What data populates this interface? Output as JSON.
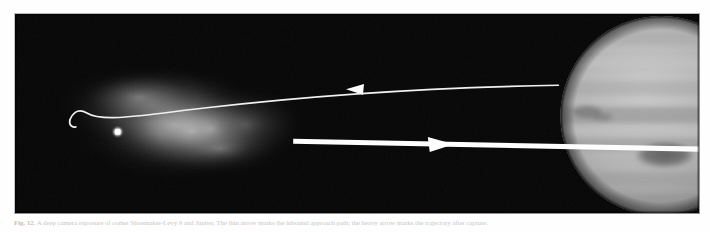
{
  "figure": {
    "caption_label": "Fig. 12.",
    "caption_text": "A deep camera exposure of comet Shoemaker-Levy 9 and Jupiter. The thin arrow marks the inbound approach path; the heavy arrow marks the trajectory after capture.",
    "alt": "Grayscale astronomical photograph: diffuse comet coma at left with bright nucleus, two white trajectory arrows pointing toward and away from the banded disk of Jupiter at right."
  },
  "plate": {
    "background_color": "#050505",
    "border_color": "#b9b9b9",
    "width": 686,
    "height": 201
  },
  "scene": {
    "comet": {
      "name": "comet-coma",
      "nucleus_label": "nucleus",
      "nucleus_x": 103,
      "nucleus_y": 119,
      "nucleus_color": "#ffffff",
      "coma_color": "#cfcfcf",
      "coma_center_x": 150,
      "coma_center_y": 105,
      "coma_rx": 105,
      "coma_ry": 62
    },
    "planet": {
      "name": "jupiter",
      "label": "Jupiter",
      "center_x": 648,
      "center_y": 103,
      "radius": 101,
      "disk_color": "#b9b9b9",
      "band_color": "#8e8e8e",
      "spot_label": "great-red-spot",
      "spot_x": 652,
      "spot_y": 143,
      "spot_rx": 29,
      "spot_ry": 13,
      "spot_color": "#6f6f6f"
    },
    "trajectories": [
      {
        "name": "inbound-path",
        "style": "thin",
        "stroke_color": "#f2f2f2",
        "stroke_width": 1.6,
        "arrow_direction": "left",
        "arrow_x": 342,
        "arrow_y": 76,
        "start_x": 545,
        "start_y": 72,
        "end_x": 55,
        "end_y": 107
      },
      {
        "name": "outbound-path",
        "style": "thick",
        "stroke_color": "#ffffff",
        "stroke_width": 5.2,
        "arrow_direction": "right",
        "arrow_x": 428,
        "arrow_y": 133,
        "start_x": 279,
        "start_y": 128,
        "end_x": 686,
        "end_y": 136
      }
    ]
  }
}
